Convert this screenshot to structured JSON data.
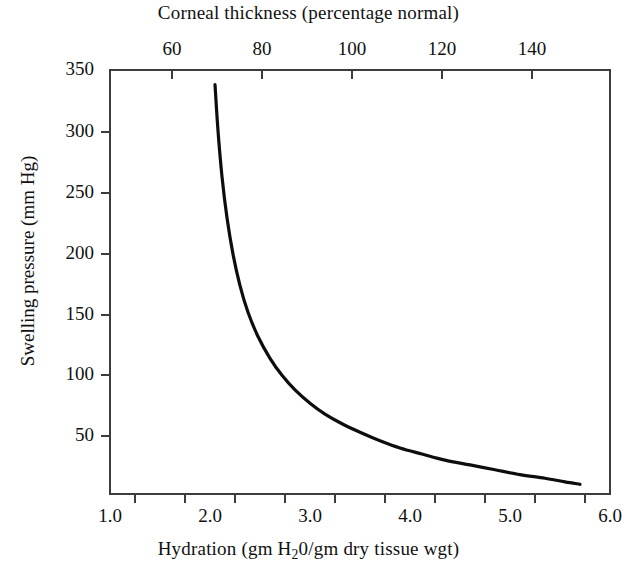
{
  "figure": {
    "top_axis_title": "Corneal thickness (percentage normal)",
    "bottom_axis_title_pre": "Hydration (gm H",
    "bottom_axis_title_sub": "2",
    "bottom_axis_title_post": "0/gm dry tissue wgt)",
    "bottom_axis_title_full": "Hydration (gm H20/gm dry tissue wgt)",
    "y_axis_title": "Swelling pressure (mm Hg)",
    "line_color": "#0d0d0d",
    "axis_color": "#3c3c3c",
    "background": "#ffffff"
  },
  "chart_data": {
    "type": "line",
    "title": "",
    "xlabel": "Hydration (gm H20/gm dry tissue wgt)",
    "ylabel": "Swelling pressure (mm Hg)",
    "top_xlabel": "Corneal thickness (percentage normal)",
    "xlim": [
      1.0,
      6.0
    ],
    "ylim": [
      0,
      350
    ],
    "top_xlim": [
      33.5,
      155.0
    ],
    "grid": false,
    "legend": null,
    "xticks": [
      1.0,
      1.5,
      2.0,
      2.5,
      3.0,
      3.5,
      4.0,
      4.5,
      5.0,
      5.5,
      6.0
    ],
    "xticklabels": [
      "1.0",
      "",
      "2.0",
      "",
      "3.0",
      "",
      "4.0",
      "",
      "5.0",
      "",
      "6.0"
    ],
    "xticklabels_major": [
      "1.0",
      "2.0",
      "3.0",
      "4.0",
      "5.0",
      "6.0"
    ],
    "yticks": [
      50,
      100,
      150,
      200,
      250,
      300,
      350
    ],
    "yticklabels": [
      "50",
      "100",
      "150",
      "200",
      "250",
      "300",
      "350"
    ],
    "top_xticks": [
      60,
      80,
      100,
      120,
      140
    ],
    "top_xticklabels": [
      "60",
      "80",
      "100",
      "120",
      "140"
    ],
    "series": [
      {
        "name": "Swelling pressure vs hydration",
        "x": [
          2.05,
          2.08,
          2.12,
          2.17,
          2.23,
          2.3,
          2.38,
          2.48,
          2.6,
          2.72,
          2.85,
          3.0,
          3.15,
          3.32,
          3.5,
          3.7,
          3.9,
          4.12,
          4.35,
          4.6,
          4.85,
          5.1,
          5.35,
          5.55,
          5.7
        ],
        "y": [
          338,
          300,
          262,
          228,
          198,
          172,
          150,
          130,
          112,
          98,
          86,
          75,
          66,
          58,
          51,
          44,
          38,
          33,
          28,
          24,
          20,
          16,
          13,
          10,
          8
        ]
      }
    ]
  }
}
